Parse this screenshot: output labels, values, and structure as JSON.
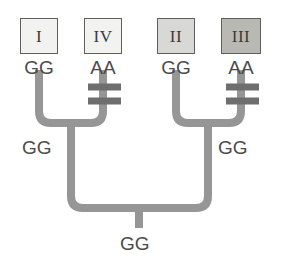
{
  "diagram": {
    "type": "phylogenetic-tree",
    "background_color": "#ffffff",
    "branch_color": "#969696",
    "mutation_mark_color": "#6e6e6e",
    "label_color": "#4a4a4a",
    "box_border_color": "#5e5e5e"
  },
  "taxa": [
    {
      "id": "taxon-1",
      "label": "I",
      "genotype": "GG",
      "box_fill": "#f2f2f0",
      "box": {
        "x": 20,
        "y": 18,
        "w": 38,
        "h": 36
      },
      "tip_x": 39,
      "geno_y": 58
    },
    {
      "id": "taxon-4",
      "label": "IV",
      "genotype": "AA",
      "box_fill": "#f2f2f0",
      "box": {
        "x": 84,
        "y": 18,
        "w": 38,
        "h": 36
      },
      "tip_x": 103,
      "geno_y": 58
    },
    {
      "id": "taxon-2",
      "label": "II",
      "genotype": "GG",
      "box_fill": "#d8d8d4",
      "box": {
        "x": 157,
        "y": 18,
        "w": 38,
        "h": 36
      },
      "tip_x": 176,
      "geno_y": 58
    },
    {
      "id": "taxon-3",
      "label": "III",
      "genotype": "AA",
      "box_fill": "#b9b9b4",
      "box": {
        "x": 221,
        "y": 18,
        "w": 40,
        "h": 36
      },
      "tip_x": 241,
      "geno_y": 58
    }
  ],
  "internal_nodes": [
    {
      "id": "node-left",
      "genotype": "GG",
      "label_x": 22,
      "label_y": 138
    },
    {
      "id": "node-right",
      "genotype": "GG",
      "label_x": 218,
      "label_y": 138
    },
    {
      "id": "node-root",
      "genotype": "GG",
      "label_x": 120,
      "label_y": 234
    }
  ],
  "mutations": [
    {
      "id": "mutation-iv-1",
      "on_branch": "taxon-4",
      "description": "substitution-tick"
    },
    {
      "id": "mutation-iv-2",
      "on_branch": "taxon-4",
      "description": "substitution-tick"
    },
    {
      "id": "mutation-iii-1",
      "on_branch": "taxon-3",
      "description": "substitution-tick"
    },
    {
      "id": "mutation-iii-2",
      "on_branch": "taxon-3",
      "description": "substitution-tick"
    }
  ]
}
